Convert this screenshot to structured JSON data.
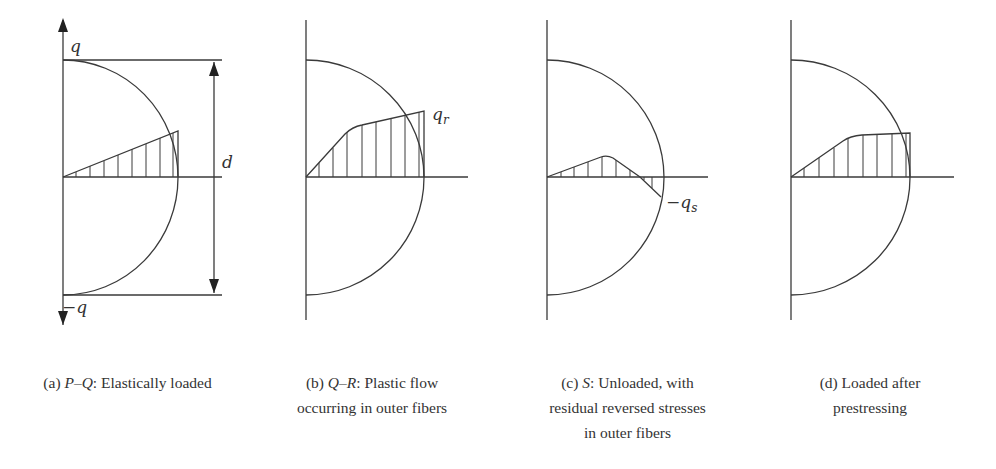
{
  "figure": {
    "panels": [
      {
        "id": "a",
        "caption_prefix": "(a) ",
        "caption_italic": "P–Q",
        "caption_rest": ": Elastically loaded",
        "caption_lines": [
          "(a) P–Q: Elastically loaded"
        ],
        "labels": {
          "top": "q",
          "bottom": "−q",
          "dimension": "d"
        },
        "stress_profile": "linear"
      },
      {
        "id": "b",
        "caption_prefix": "(b) ",
        "caption_italic": "Q–R",
        "caption_rest": ": Plastic flow",
        "caption_line2": "occurring in outer fibers",
        "labels": {
          "stress": "q",
          "stress_sub": "r"
        },
        "stress_profile": "plastic"
      },
      {
        "id": "c",
        "caption_prefix": "(c) ",
        "caption_italic": "S",
        "caption_rest": ": Unloaded, with",
        "caption_line2": "residual reversed stresses",
        "caption_line3": "in outer fibers",
        "labels": {
          "stress": "−q",
          "stress_sub": "s"
        },
        "stress_profile": "residual"
      },
      {
        "id": "d",
        "caption_prefix": "(d) Loaded after",
        "caption_line2": "prestressing",
        "stress_profile": "prestressed"
      }
    ]
  },
  "colors": {
    "line": "#3a3a3a",
    "text": "#333333",
    "background": "#ffffff"
  }
}
